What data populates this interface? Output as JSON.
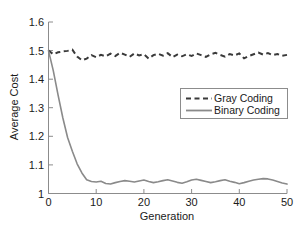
{
  "chart_data": {
    "type": "line",
    "title": "",
    "xlabel": "Generation",
    "ylabel": "Average Cost",
    "xlim": [
      0,
      50
    ],
    "ylim": [
      1.0,
      1.6
    ],
    "xticks": [
      0,
      10,
      20,
      30,
      40,
      50
    ],
    "yticks": [
      1,
      1.1,
      1.2,
      1.3,
      1.4,
      1.5,
      1.6
    ],
    "xtick_labels": [
      "0",
      "10",
      "20",
      "30",
      "40",
      "50"
    ],
    "ytick_labels": [
      "1",
      "1.1",
      "1.2",
      "1.3",
      "1.4",
      "1.5",
      "1.6"
    ],
    "grid": false,
    "legend_position": "center-right",
    "x": [
      0,
      1,
      2,
      3,
      4,
      5,
      6,
      7,
      8,
      9,
      10,
      11,
      12,
      13,
      14,
      15,
      16,
      17,
      18,
      19,
      20,
      21,
      22,
      23,
      24,
      25,
      26,
      27,
      28,
      29,
      30,
      31,
      32,
      33,
      34,
      35,
      36,
      37,
      38,
      39,
      40,
      41,
      42,
      43,
      44,
      45,
      46,
      47,
      48,
      49,
      50
    ],
    "series": [
      {
        "name": "Gray Coding",
        "style": "dashed",
        "color": "#3a3a3a",
        "values": [
          1.5,
          1.487,
          1.494,
          1.497,
          1.499,
          1.503,
          1.479,
          1.466,
          1.472,
          1.484,
          1.477,
          1.485,
          1.48,
          1.489,
          1.481,
          1.492,
          1.486,
          1.478,
          1.49,
          1.483,
          1.487,
          1.472,
          1.484,
          1.489,
          1.482,
          1.491,
          1.477,
          1.486,
          1.48,
          1.487,
          1.481,
          1.49,
          1.484,
          1.478,
          1.487,
          1.492,
          1.485,
          1.479,
          1.488,
          1.483,
          1.49,
          1.473,
          1.481,
          1.487,
          1.493,
          1.486,
          1.491,
          1.484,
          1.488,
          1.482,
          1.485
        ]
      },
      {
        "name": "Binary Coding",
        "style": "solid",
        "color": "#8a8a8a",
        "values": [
          1.5,
          1.43,
          1.345,
          1.265,
          1.196,
          1.148,
          1.104,
          1.072,
          1.048,
          1.042,
          1.04,
          1.043,
          1.035,
          1.033,
          1.038,
          1.042,
          1.045,
          1.043,
          1.04,
          1.044,
          1.047,
          1.042,
          1.038,
          1.041,
          1.045,
          1.048,
          1.044,
          1.039,
          1.036,
          1.041,
          1.047,
          1.05,
          1.046,
          1.042,
          1.038,
          1.041,
          1.045,
          1.048,
          1.043,
          1.039,
          1.034,
          1.038,
          1.043,
          1.047,
          1.05,
          1.052,
          1.051,
          1.047,
          1.042,
          1.037,
          1.033
        ]
      }
    ]
  },
  "legend": {
    "entries": [
      {
        "label": "Gray Coding"
      },
      {
        "label": "Binary Coding"
      }
    ]
  }
}
